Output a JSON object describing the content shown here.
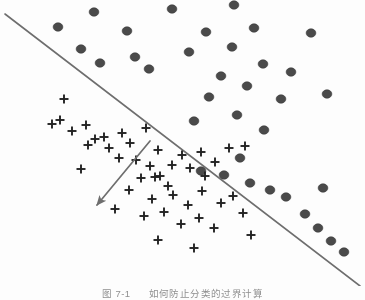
{
  "figure": {
    "caption_label": "图 7-1",
    "caption_title": "如何防止分类的过界计算",
    "background_color": "#fdfdfd",
    "width": 365,
    "height": 300
  },
  "chart_data": {
    "type": "scatter",
    "title": "",
    "subtitle": "",
    "xlabel": "",
    "ylabel": "",
    "xlim": [
      0,
      365
    ],
    "ylim": [
      0,
      286
    ],
    "grid": false,
    "axes_visible": false,
    "legend": null,
    "legend_position": "none",
    "marker_colors": {
      "circle_fill": "#4a4a4a",
      "circle_stroke": "#3a3a3a",
      "plus_stroke": "#222222",
      "boundary_line": "#6e6e6e",
      "arrow_line": "#6e6e6e"
    },
    "series": [
      {
        "name": "class-circle",
        "marker": "circle",
        "color": "#4a4a4a",
        "marker_size": 9,
        "count": 35,
        "points": [
          [
            94,
            12
          ],
          [
            172,
            9
          ],
          [
            234,
            5
          ],
          [
            58,
            27
          ],
          [
            127,
            31
          ],
          [
            206,
            32
          ],
          [
            254,
            28
          ],
          [
            311,
            33
          ],
          [
            81,
            49
          ],
          [
            135,
            57
          ],
          [
            189,
            52
          ],
          [
            232,
            47
          ],
          [
            100,
            63
          ],
          [
            149,
            69
          ],
          [
            221,
            76
          ],
          [
            263,
            64
          ],
          [
            291,
            72
          ],
          [
            247,
            86
          ],
          [
            209,
            97
          ],
          [
            281,
            99
          ],
          [
            327,
            94
          ],
          [
            237,
            115
          ],
          [
            194,
            121
          ],
          [
            264,
            130
          ],
          [
            240,
            158
          ],
          [
            201,
            171
          ],
          [
            224,
            175
          ],
          [
            250,
            183
          ],
          [
            270,
            190
          ],
          [
            286,
            197
          ],
          [
            323,
            188
          ],
          [
            305,
            214
          ],
          [
            318,
            228
          ],
          [
            331,
            241
          ],
          [
            344,
            252
          ]
        ]
      },
      {
        "name": "class-plus",
        "marker": "plus",
        "color": "#222222",
        "marker_size": 9,
        "count": 46,
        "points": [
          [
            64,
            99
          ],
          [
            52,
            124
          ],
          [
            60,
            120
          ],
          [
            72,
            131
          ],
          [
            86,
            125
          ],
          [
            95,
            139
          ],
          [
            88,
            145
          ],
          [
            104,
            137
          ],
          [
            109,
            148
          ],
          [
            122,
            133
          ],
          [
            130,
            143
          ],
          [
            119,
            158
          ],
          [
            136,
            160
          ],
          [
            81,
            169
          ],
          [
            146,
            128
          ],
          [
            158,
            150
          ],
          [
            150,
            166
          ],
          [
            141,
            178
          ],
          [
            155,
            177
          ],
          [
            160,
            176
          ],
          [
            172,
            165
          ],
          [
            168,
            186
          ],
          [
            182,
            155
          ],
          [
            190,
            168
          ],
          [
            201,
            152
          ],
          [
            205,
            176
          ],
          [
            215,
            162
          ],
          [
            229,
            148
          ],
          [
            245,
            146
          ],
          [
            129,
            190
          ],
          [
            152,
            199
          ],
          [
            173,
            195
          ],
          [
            188,
            205
          ],
          [
            202,
            191
          ],
          [
            221,
            203
          ],
          [
            233,
            196
          ],
          [
            115,
            209
          ],
          [
            144,
            216
          ],
          [
            164,
            212
          ],
          [
            181,
            224
          ],
          [
            199,
            218
          ],
          [
            214,
            228
          ],
          [
            243,
            213
          ],
          [
            158,
            240
          ],
          [
            194,
            248
          ],
          [
            251,
            235
          ]
        ]
      }
    ],
    "annotations": [
      {
        "name": "decision-boundary",
        "type": "line",
        "x1": 5,
        "y1": 14,
        "x2": 360,
        "y2": 286,
        "color": "#6e6e6e",
        "width": 1.6
      },
      {
        "name": "margin-arrow",
        "type": "arrow",
        "x1": 150,
        "y1": 141,
        "x2": 97,
        "y2": 205,
        "color": "#6e6e6e",
        "width": 1.7,
        "head": "end"
      }
    ]
  }
}
